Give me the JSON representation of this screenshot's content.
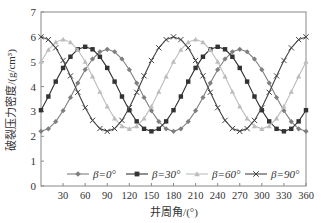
{
  "chart_data": {
    "type": "line",
    "title": "",
    "xlabel": "井周角/(°)",
    "ylabel": "破裂压力密度/(g/cm³)",
    "xlim": [
      0,
      360
    ],
    "ylim": [
      0,
      7
    ],
    "xticks": [
      30,
      60,
      90,
      120,
      150,
      180,
      210,
      240,
      270,
      300,
      330,
      360
    ],
    "yticks": [
      0,
      1,
      2,
      3,
      4,
      5,
      6,
      7
    ],
    "grid": false,
    "legend_position": "inside-bottom",
    "x": [
      0,
      10,
      20,
      30,
      40,
      50,
      60,
      70,
      80,
      90,
      100,
      110,
      120,
      130,
      140,
      150,
      160,
      170,
      180,
      190,
      200,
      210,
      220,
      230,
      240,
      250,
      260,
      270,
      280,
      290,
      300,
      310,
      320,
      330,
      340,
      350,
      360
    ],
    "series": [
      {
        "name": "β=0°",
        "marker": "diamond",
        "color": "#7f7f7f",
        "values": [
          2.2,
          2.3,
          2.59,
          3.03,
          3.56,
          4.14,
          4.68,
          5.11,
          5.4,
          5.5,
          5.4,
          5.11,
          4.68,
          4.14,
          3.56,
          3.03,
          2.59,
          2.3,
          2.2,
          2.3,
          2.59,
          3.03,
          3.56,
          4.14,
          4.68,
          5.11,
          5.4,
          5.5,
          5.4,
          5.11,
          4.68,
          4.14,
          3.56,
          3.03,
          2.59,
          2.3,
          2.2
        ]
      },
      {
        "name": "β=30°",
        "marker": "square",
        "color": "#333333",
        "values": [
          3.05,
          3.6,
          4.2,
          4.75,
          5.2,
          5.5,
          5.6,
          5.5,
          5.2,
          4.75,
          4.2,
          3.6,
          3.05,
          2.6,
          2.3,
          2.2,
          2.3,
          2.6,
          3.05,
          3.6,
          4.2,
          4.75,
          5.2,
          5.5,
          5.6,
          5.5,
          5.2,
          4.75,
          4.2,
          3.6,
          3.05,
          2.6,
          2.3,
          2.2,
          2.3,
          2.6,
          3.05
        ]
      },
      {
        "name": "β=60°",
        "marker": "triangle",
        "color": "#bdbdbd",
        "values": [
          5.0,
          5.48,
          5.79,
          5.9,
          5.79,
          5.48,
          5.0,
          4.41,
          3.79,
          3.2,
          2.72,
          2.41,
          2.3,
          2.41,
          2.72,
          3.2,
          3.79,
          4.41,
          5.0,
          5.48,
          5.79,
          5.9,
          5.79,
          5.48,
          5.0,
          4.41,
          3.79,
          3.2,
          2.72,
          2.41,
          2.3,
          2.41,
          2.72,
          3.2,
          3.79,
          4.41,
          5.0
        ]
      },
      {
        "name": "β=90°",
        "marker": "x",
        "color": "#444444",
        "values": [
          6.0,
          5.89,
          5.56,
          5.05,
          4.43,
          3.77,
          3.15,
          2.64,
          2.31,
          2.2,
          2.31,
          2.64,
          3.15,
          3.77,
          4.43,
          5.05,
          5.56,
          5.89,
          6.0,
          5.89,
          5.56,
          5.05,
          4.43,
          3.77,
          3.15,
          2.64,
          2.31,
          2.2,
          2.31,
          2.64,
          3.15,
          3.77,
          4.43,
          5.05,
          5.56,
          5.89,
          6.0
        ]
      }
    ]
  }
}
